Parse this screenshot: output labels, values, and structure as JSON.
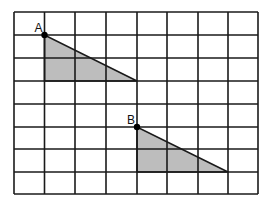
{
  "grid": {
    "columns": 8,
    "rows": 8,
    "x_lines": [
      14,
      44.5,
      75,
      106,
      137,
      167,
      198,
      228,
      258
    ],
    "y_lines": [
      12,
      35,
      58,
      81,
      104,
      127,
      149,
      172,
      194
    ],
    "line_color": "#1a1a1a"
  },
  "shapes": [
    {
      "name": "triangle-a",
      "label": "A",
      "vertices_grid": [
        [
          1,
          1
        ],
        [
          1,
          3
        ],
        [
          4,
          3
        ]
      ],
      "fill": "#bdbdbd",
      "label_offset": [
        -8,
        -3
      ]
    },
    {
      "name": "triangle-b",
      "label": "B",
      "vertices_grid": [
        [
          4,
          5
        ],
        [
          4,
          7
        ],
        [
          7,
          7
        ]
      ],
      "fill": "#bdbdbd",
      "label_offset": [
        -8,
        -3
      ]
    }
  ]
}
